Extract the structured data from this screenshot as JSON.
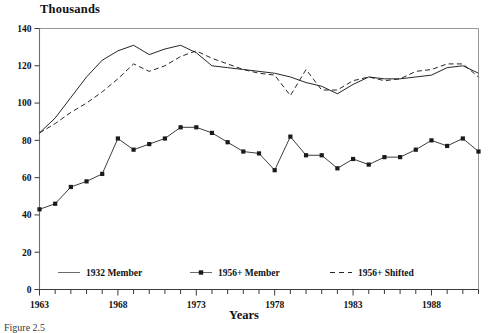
{
  "figure": {
    "ylabel_title": "Thousands",
    "xlabel_title": "Years",
    "caption": "Figure 2.5"
  },
  "chart_data": {
    "type": "line",
    "title": "",
    "subtitle": "",
    "xlabel": "Years",
    "ylabel": "Thousands",
    "ylim": [
      0,
      140
    ],
    "xlim": [
      1963,
      1991
    ],
    "ytick_labels": [
      "0",
      "20",
      "40",
      "60",
      "80",
      "100",
      "120",
      "140"
    ],
    "yticks": [
      0,
      20,
      40,
      60,
      80,
      100,
      120,
      140
    ],
    "xtick_labels": [
      "1963",
      "1968",
      "1973",
      "1978",
      "1983",
      "1988"
    ],
    "xticks_labeled": [
      1963,
      1968,
      1973,
      1978,
      1983,
      1988
    ],
    "xticks_minor_every": 1,
    "grid": false,
    "legend_position": "inside-bottom",
    "x": [
      1963,
      1964,
      1965,
      1966,
      1967,
      1968,
      1969,
      1970,
      1971,
      1972,
      1973,
      1974,
      1975,
      1976,
      1977,
      1978,
      1979,
      1980,
      1981,
      1982,
      1983,
      1984,
      1985,
      1986,
      1987,
      1988,
      1989,
      1990,
      1991
    ],
    "series": [
      {
        "name": "1932 Member",
        "style": "solid",
        "marker": "none",
        "color": "#1a1a1a",
        "values": [
          84,
          92,
          103,
          114,
          123,
          128,
          131,
          126,
          129,
          131,
          127,
          120,
          119,
          118,
          117,
          116,
          114,
          111,
          109,
          105,
          110,
          114,
          113,
          113,
          114,
          115,
          119,
          120,
          116
        ]
      },
      {
        "name": "1956+ Member",
        "style": "solid",
        "marker": "square",
        "color": "#1a1a1a",
        "values": [
          43,
          46,
          55,
          58,
          62,
          81,
          75,
          78,
          81,
          87,
          87,
          84,
          79,
          74,
          73,
          64,
          82,
          72,
          72,
          65,
          70,
          67,
          71,
          71,
          75,
          80,
          77,
          81,
          74
        ]
      },
      {
        "name": "1956+ Shifted",
        "style": "dashed",
        "marker": "none",
        "color": "#1a1a1a",
        "values": [
          84,
          89,
          95,
          100,
          106,
          113,
          121,
          117,
          120,
          125,
          128,
          124,
          121,
          118,
          116,
          115,
          104,
          118,
          107,
          107,
          112,
          114,
          112,
          113,
          117,
          118,
          121,
          121,
          114
        ]
      }
    ]
  },
  "legend": {
    "items": [
      {
        "label": "1932 Member",
        "style": "solid",
        "marker": "none"
      },
      {
        "label": "1956+ Member",
        "style": "solid",
        "marker": "square"
      },
      {
        "label": "1956+ Shifted",
        "style": "dashed",
        "marker": "none"
      }
    ]
  }
}
